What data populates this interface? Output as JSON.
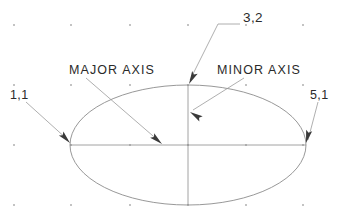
{
  "drawing": {
    "title": "Ellipse construction — major and minor axis annotation",
    "background_color": "#ffffff",
    "line_color": "#8c8c8c",
    "leader_color": "#9a9a9a",
    "arrow_color": "#3a3a3a",
    "text_color": "#2a2a2a",
    "grid_dot_color": "#b5b5b5"
  },
  "labels": {
    "major_axis": "MAJOR AXIS",
    "minor_axis": "MINOR AXIS",
    "point_top": "3,2",
    "point_left": "1,1",
    "point_right": "5,1"
  },
  "geometry": {
    "ellipse": {
      "center_x": 188,
      "center_y": 145,
      "radius_x": 118,
      "radius_y": 60
    },
    "major_axis_line": {
      "x1": 70,
      "y1": 145,
      "x2": 306,
      "y2": 145
    },
    "minor_axis_line": {
      "x1": 188,
      "y1": 85,
      "x2": 188,
      "y2": 205
    },
    "vertices": {
      "left": {
        "x": 70,
        "y": 145,
        "label": "1,1"
      },
      "right": {
        "x": 306,
        "y": 145,
        "label": "5,1"
      },
      "top": {
        "x": 188,
        "y": 85,
        "label": "3,2"
      }
    },
    "grid_dots": {
      "x_positions": [
        14,
        71,
        130,
        188,
        246,
        303
      ],
      "y_positions": [
        25,
        85,
        145,
        205
      ],
      "spacing_x": 58,
      "spacing_y": 60
    }
  },
  "leaders": [
    {
      "name": "leader-point-top",
      "label": "3,2",
      "points": "240,24 218,24 190,80",
      "arrow_tip_x": 189,
      "arrow_tip_y": 84,
      "arrow_angle_deg": 117
    },
    {
      "name": "leader-major-axis",
      "label": "MAJOR AXIS",
      "points": "86,78 160,142",
      "arrow_tip_x": 162,
      "arrow_tip_y": 144,
      "arrow_angle_deg": 41
    },
    {
      "name": "leader-minor-axis",
      "label": "MINOR AXIS",
      "points": "244,78 193,110",
      "arrow_tip_x": 190,
      "arrow_tip_y": 112,
      "arrow_angle_deg": 212
    },
    {
      "name": "leader-point-left",
      "label": "1,1",
      "points": "26,102 68,140",
      "arrow_tip_x": 70,
      "arrow_tip_y": 143,
      "arrow_angle_deg": 47
    },
    {
      "name": "leader-point-right",
      "label": "5,1",
      "points": "318,102 308,140",
      "arrow_tip_x": 306,
      "arrow_tip_y": 143,
      "arrow_angle_deg": 104
    }
  ]
}
